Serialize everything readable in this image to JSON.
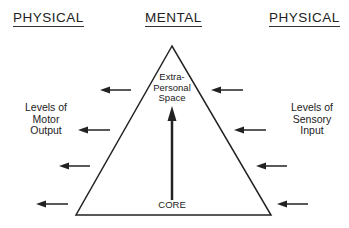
{
  "headers": {
    "left": "PHYSICAL",
    "center": "MENTAL",
    "right": "PHYSICAL"
  },
  "labels": {
    "motor": [
      "Levels of",
      "Motor",
      "Output"
    ],
    "sensory": [
      "Levels of",
      "Sensory",
      "Input"
    ],
    "apex": [
      "Extra-",
      "Personal",
      "Space"
    ],
    "core": "CORE"
  },
  "colors": {
    "line": "#222222",
    "background": "#ffffff"
  }
}
